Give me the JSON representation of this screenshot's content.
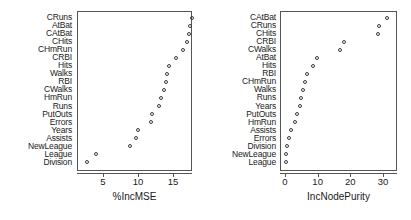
{
  "chart_data": [
    {
      "type": "scatter",
      "title": "",
      "xlabel": "%IncMSE",
      "ylabel": "",
      "xlim": [
        2.0,
        18.6
      ],
      "xticks": [
        5,
        10,
        15
      ],
      "grid": false,
      "legend": null,
      "orientation": "dotchart-horizontal",
      "categories": [
        "CRuns",
        "AtBat",
        "CAtBat",
        "CHits",
        "CHmRun",
        "CRBI",
        "Hits",
        "Walks",
        "RBI",
        "CWalks",
        "HmRun",
        "Runs",
        "PutOuts",
        "Errors",
        "Years",
        "Assists",
        "NewLeague",
        "League",
        "Division"
      ],
      "values": [
        17.9,
        17.6,
        17.4,
        17.2,
        16.6,
        15.6,
        14.5,
        14.3,
        14.1,
        13.8,
        13.4,
        13.1,
        12.2,
        12.0,
        10.1,
        9.9,
        9.0,
        4.2,
        2.8
      ]
    },
    {
      "type": "scatter",
      "title": "",
      "xlabel": "IncNodePurity",
      "ylabel": "",
      "xlim": [
        -1.0,
        34.5
      ],
      "xticks": [
        0,
        10,
        20,
        30
      ],
      "grid": false,
      "legend": null,
      "orientation": "dotchart-horizontal",
      "categories": [
        "CAtBat",
        "CRuns",
        "CHits",
        "CRBI",
        "CWalks",
        "AtBat",
        "Hits",
        "RBI",
        "CHmRun",
        "Walks",
        "Runs",
        "Years",
        "PutOuts",
        "HmRun",
        "Assists",
        "Errors",
        "Division",
        "NewLeague",
        "League"
      ],
      "values": [
        31.5,
        29.2,
        28.8,
        18.3,
        17.1,
        10.0,
        9.0,
        6.9,
        6.3,
        5.9,
        5.2,
        4.9,
        4.0,
        3.3,
        2.2,
        1.6,
        0.9,
        0.7,
        0.5
      ]
    }
  ],
  "panels": [
    {
      "id": "left",
      "xlabel": "%IncMSE",
      "xticks": [
        "5",
        "10",
        "15"
      ],
      "labels": [
        "CRuns",
        "AtBat",
        "CAtBat",
        "CHits",
        "CHmRun",
        "CRBI",
        "Hits",
        "Walks",
        "RBI",
        "CWalks",
        "HmRun",
        "Runs",
        "PutOuts",
        "Errors",
        "Years",
        "Assists",
        "NewLeague",
        "League",
        "Division"
      ]
    },
    {
      "id": "right",
      "xlabel": "IncNodePurity",
      "xticks": [
        "0",
        "10",
        "20",
        "30"
      ],
      "labels": [
        "CAtBat",
        "CRuns",
        "CHits",
        "CRBI",
        "CWalks",
        "AtBat",
        "Hits",
        "RBI",
        "CHmRun",
        "Walks",
        "Runs",
        "Years",
        "PutOuts",
        "HmRun",
        "Assists",
        "Errors",
        "Division",
        "NewLeague",
        "League"
      ]
    }
  ],
  "style": {
    "point_color": "#3a3a3a",
    "frame_color": "#555555",
    "text_color": "#1a1a1a",
    "background": "#ffffff"
  }
}
